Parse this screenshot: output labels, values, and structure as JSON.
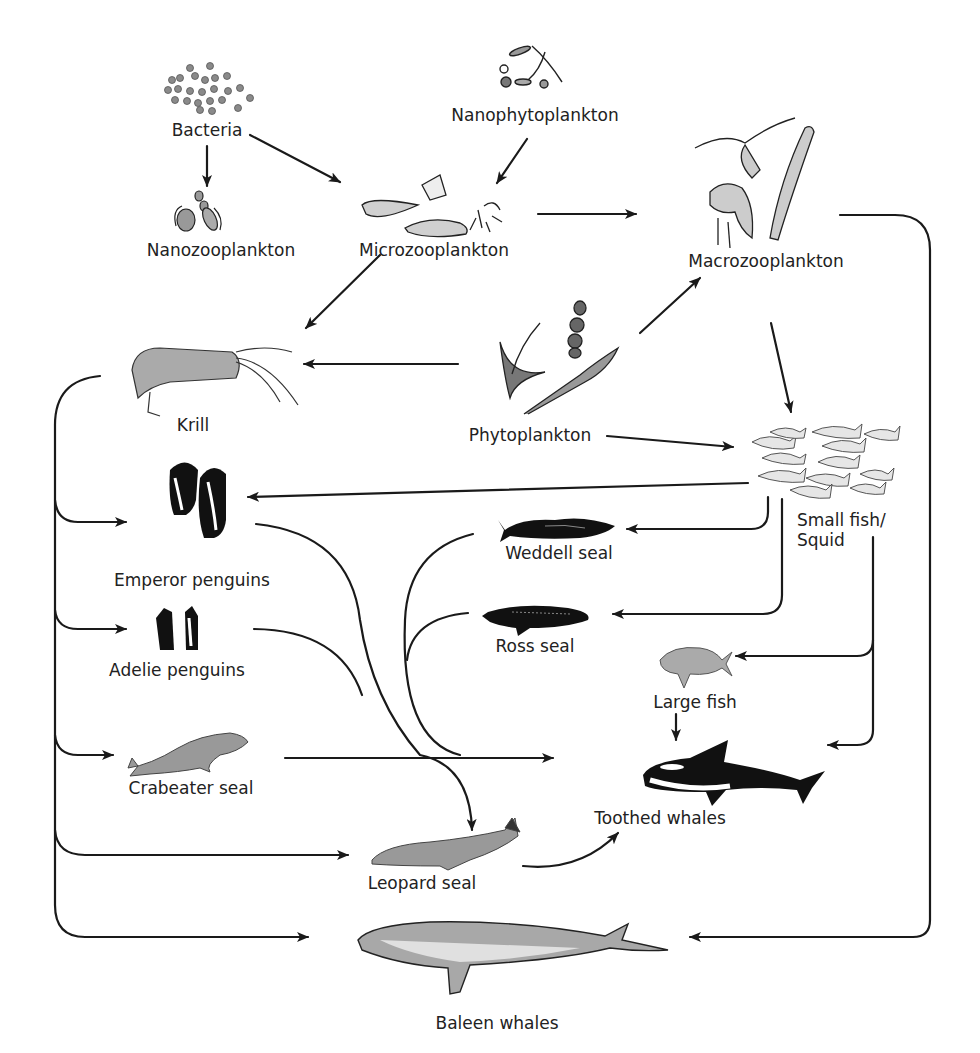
{
  "diagram": {
    "nodes": {
      "bacteria": "Bacteria",
      "nanophytoplankton": "Nanophytoplankton",
      "nanozooplankton": "Nanozooplankton",
      "microzooplankton": "Microzooplankton",
      "macrozooplankton": "Macrozooplankton",
      "krill": "Krill",
      "phytoplankton": "Phytoplankton",
      "small_fish_line1": "Small fish/",
      "small_fish_line2": "Squid",
      "emperor_penguins": "Emperor penguins",
      "weddell_seal": "Weddell seal",
      "ross_seal": "Ross seal",
      "adelie_penguins": "Adelie penguins",
      "large_fish": "Large fish",
      "crabeater_seal": "Crabeater seal",
      "toothed_whales": "Toothed whales",
      "leopard_seal": "Leopard seal",
      "baleen_whales": "Baleen whales"
    },
    "edges": [
      {
        "from": "Bacteria",
        "to": "Nanozooplankton"
      },
      {
        "from": "Bacteria",
        "to": "Microzooplankton"
      },
      {
        "from": "Nanophytoplankton",
        "to": "Microzooplankton"
      },
      {
        "from": "Microzooplankton",
        "to": "Macrozooplankton"
      },
      {
        "from": "Microzooplankton",
        "to": "Krill"
      },
      {
        "from": "Phytoplankton",
        "to": "Krill"
      },
      {
        "from": "Phytoplankton",
        "to": "Macrozooplankton"
      },
      {
        "from": "Phytoplankton",
        "to": "Small fish/Squid"
      },
      {
        "from": "Macrozooplankton",
        "to": "Small fish/Squid"
      },
      {
        "from": "Macrozooplankton",
        "to": "Baleen whales"
      },
      {
        "from": "Small fish/Squid",
        "to": "Emperor penguins"
      },
      {
        "from": "Small fish/Squid",
        "to": "Weddell seal"
      },
      {
        "from": "Small fish/Squid",
        "to": "Ross seal"
      },
      {
        "from": "Small fish/Squid",
        "to": "Large fish"
      },
      {
        "from": "Small fish/Squid",
        "to": "Toothed whales"
      },
      {
        "from": "Large fish",
        "to": "Toothed whales"
      },
      {
        "from": "Krill",
        "to": "Emperor penguins"
      },
      {
        "from": "Krill",
        "to": "Adelie penguins"
      },
      {
        "from": "Krill",
        "to": "Crabeater seal"
      },
      {
        "from": "Krill",
        "to": "Leopard seal"
      },
      {
        "from": "Krill",
        "to": "Baleen whales"
      },
      {
        "from": "Emperor penguins",
        "to": "Leopard seal"
      },
      {
        "from": "Adelie penguins",
        "to": "Leopard seal"
      },
      {
        "from": "Weddell seal",
        "to": "Toothed whales"
      },
      {
        "from": "Ross seal",
        "to": "Toothed whales"
      },
      {
        "from": "Crabeater seal",
        "to": "Toothed whales"
      },
      {
        "from": "Leopard seal",
        "to": "Toothed whales"
      }
    ],
    "colors": {
      "line": "#1a1a1a",
      "fill_gray": "#9a9a9a",
      "fill_light": "#d8d8d8",
      "fill_dark": "#111111"
    }
  }
}
